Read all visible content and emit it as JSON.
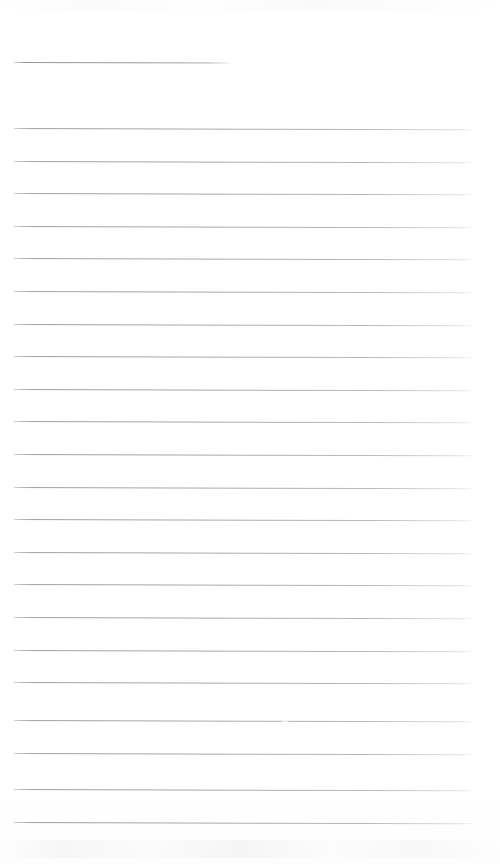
{
  "document": {
    "kind": "scanned-lined-notepaper",
    "title_text": "",
    "body_text": "",
    "page_width": 500,
    "page_height": 864,
    "background_color": "#ffffff",
    "rule_color": "#9ba0a6",
    "rule_thickness_px": 1,
    "rule_spacing_px": 32.5,
    "left_margin_px": 14,
    "right_edge_px": 473,
    "skew_degrees": 0.16,
    "is_blank": true,
    "written_content": "none"
  },
  "header_rule": {
    "label": "title-rule",
    "y": 62,
    "x_start": 14,
    "x_end": 230,
    "length_px": 216,
    "note": "short rule reserved for a title or date, left aligned"
  },
  "rules": [
    {
      "index": 1,
      "y": 128,
      "x_start": 14,
      "x_end": 473
    },
    {
      "index": 2,
      "y": 161,
      "x_start": 14,
      "x_end": 473
    },
    {
      "index": 3,
      "y": 193,
      "x_start": 14,
      "x_end": 473
    },
    {
      "index": 4,
      "y": 226,
      "x_start": 14,
      "x_end": 473
    },
    {
      "index": 5,
      "y": 258,
      "x_start": 14,
      "x_end": 473
    },
    {
      "index": 6,
      "y": 291,
      "x_start": 14,
      "x_end": 473
    },
    {
      "index": 7,
      "y": 324,
      "x_start": 14,
      "x_end": 473
    },
    {
      "index": 8,
      "y": 356,
      "x_start": 14,
      "x_end": 473
    },
    {
      "index": 9,
      "y": 389,
      "x_start": 14,
      "x_end": 473
    },
    {
      "index": 10,
      "y": 421,
      "x_start": 14,
      "x_end": 473
    },
    {
      "index": 11,
      "y": 454,
      "x_start": 14,
      "x_end": 473
    },
    {
      "index": 12,
      "y": 487,
      "x_start": 14,
      "x_end": 473
    },
    {
      "index": 13,
      "y": 519,
      "x_start": 14,
      "x_end": 473
    },
    {
      "index": 14,
      "y": 552,
      "x_start": 14,
      "x_end": 473
    },
    {
      "index": 15,
      "y": 584,
      "x_start": 14,
      "x_end": 473
    },
    {
      "index": 16,
      "y": 617,
      "x_start": 14,
      "x_end": 473
    },
    {
      "index": 17,
      "y": 650,
      "x_start": 14,
      "x_end": 473
    },
    {
      "index": 18,
      "y": 682,
      "x_start": 14,
      "x_end": 473
    },
    {
      "index": 19,
      "y": 720,
      "x_start": 14,
      "x_end": 473,
      "artifact": "faint break near x=285"
    },
    {
      "index": 20,
      "y": 753,
      "x_start": 14,
      "x_end": 473
    },
    {
      "index": 21,
      "y": 789,
      "x_start": 14,
      "x_end": 473
    },
    {
      "index": 22,
      "y": 822,
      "x_start": 14,
      "x_end": 473
    }
  ],
  "artifacts": {
    "line19_gap_x": 282,
    "line19_gap_width": 6,
    "bottom_smudge_y": 840,
    "top_noise_y": 0
  }
}
